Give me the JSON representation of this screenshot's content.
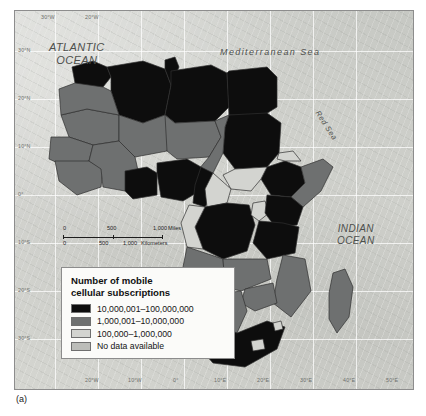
{
  "figure": {
    "caption": "(a)"
  },
  "map": {
    "sea_labels": [
      {
        "name": "atlantic-ocean",
        "line1": "ATLANTIC",
        "line2": "OCEAN"
      },
      {
        "name": "indian-ocean",
        "line1": "INDIAN",
        "line2": "OCEAN"
      },
      {
        "name": "mediterranean-sea",
        "text": "Mediterranean  Sea"
      },
      {
        "name": "red-sea",
        "text": "Red Sea"
      }
    ],
    "longitude_labels_top": [
      "30°W",
      "20°W"
    ],
    "longitude_labels_bottom": [
      "20°W",
      "10°W",
      "0°",
      "10°E",
      "20°E",
      "30°E",
      "40°E",
      "50°E"
    ],
    "latitude_labels": [
      "30°N",
      "20°N",
      "10°N",
      "0°",
      "10°S",
      "20°S",
      "30°S"
    ]
  },
  "scalebar": {
    "miles": {
      "zero": "0",
      "mid": "500",
      "max": "1,000",
      "unit": "Miles"
    },
    "kilometers": {
      "zero": "0",
      "mid": "500",
      "max": "1,000",
      "unit": "Kilometers"
    }
  },
  "legend": {
    "title_line1": "Number of mobile",
    "title_line2": "cellular subscriptions",
    "entries": [
      {
        "label": "10,000,001–100,000,000",
        "color": "#0d0d0d"
      },
      {
        "label": "1,000,001–10,000,000",
        "color": "#6e7070"
      },
      {
        "label": "100,000–1,000,000",
        "color": "#d3d4d0"
      },
      {
        "label": "No data available",
        "color": "#bcbdb9"
      }
    ]
  },
  "colors": {
    "high": "#0d0d0d",
    "mid": "#6e7070",
    "low": "#d3d4d0",
    "nodata": "#bcbdb9",
    "ocean": "#cbccc7",
    "border": "#3a3a3a"
  }
}
